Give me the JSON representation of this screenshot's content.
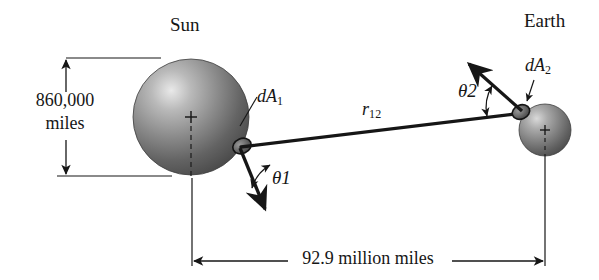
{
  "figure": {
    "title_alt": "Radiation exchange between the Sun and the Earth",
    "background_color": "#ffffff",
    "ink_color": "#161616"
  },
  "bodies": [
    {
      "key": "sun",
      "label": "Sun",
      "center_x": 191,
      "center_y": 117,
      "radius": 58,
      "surface_color_dark": "#4a4a4a",
      "surface_color_light": "#d8d8d8"
    },
    {
      "key": "earth",
      "label": "Earth",
      "center_x": 545,
      "center_y": 130,
      "radius": 26,
      "surface_color_dark": "#4a4a4a",
      "surface_color_light": "#d0d0d0"
    }
  ],
  "labels": {
    "sun": "Sun",
    "earth": "Earth",
    "dA1_d": "d",
    "dA1_A": "A",
    "dA1_sub": "1",
    "dA2_d": "d",
    "dA2_A": "A",
    "dA2_sub": "2",
    "r12_r": "r",
    "r12_sub": "12",
    "theta1": "θ",
    "theta1_sub": "1",
    "theta2": "θ",
    "theta2_sub": "2"
  },
  "dimensions": {
    "diameter": {
      "line1": "860,000",
      "line2": "miles",
      "full_text": "860,000 miles",
      "value": 860000,
      "unit": "miles",
      "measures": "Sun diameter",
      "orientation": "vertical"
    },
    "distance": {
      "text": "92.9 million miles",
      "value": 92900000,
      "unit": "miles",
      "measures": "Sun-to-Earth center distance",
      "orientation": "horizontal"
    }
  },
  "geometry": {
    "dA1_patch": {
      "x": 242,
      "y": 146
    },
    "dA2_patch": {
      "x": 521,
      "y": 112
    },
    "r12_line": {
      "x1": 242,
      "y1": 146,
      "x2": 521,
      "y2": 112
    },
    "normal1_arrow": {
      "x1": 242,
      "y1": 146,
      "x2": 266,
      "y2": 212
    },
    "normal2_arrow": {
      "x1": 521,
      "y1": 112,
      "x2": 467,
      "y2": 62
    }
  }
}
